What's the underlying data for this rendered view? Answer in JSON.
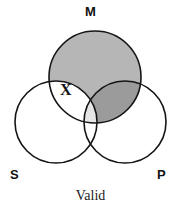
{
  "figure": {
    "caption": "Valid",
    "labels": {
      "middle": "M",
      "subject": "S",
      "predicate": "P"
    },
    "marks": {
      "existential_x": "X"
    }
  },
  "colors": {
    "background": "#ffffff",
    "outline": "#141414",
    "m_region_fill": "#b6b6b6",
    "m_p_overlap_fill": "#9b9b9b",
    "m_s_p_center_fill": "#e6e6e6",
    "unshaded_fill": "#ffffff",
    "label_color": "#111111"
  },
  "chart_data": {
    "type": "diagram",
    "diagram_kind": "venn-3-circle-syllogism",
    "title": "Valid",
    "circles": [
      {
        "id": "M",
        "label": "M",
        "cx": 95,
        "cy": 77,
        "r": 46,
        "label_position": "top"
      },
      {
        "id": "S",
        "label": "S",
        "cx": 56,
        "cy": 122,
        "r": 41,
        "label_position": "bottom-left"
      },
      {
        "id": "P",
        "label": "P",
        "cx": 125,
        "cy": 122,
        "r": 41,
        "label_position": "bottom-right"
      }
    ],
    "regions": [
      {
        "id": "M-only",
        "description": "M outside S and P",
        "shading": "medium-gray",
        "fill": "#b6b6b6"
      },
      {
        "id": "M-and-S",
        "description": "M intersect S outside P",
        "shading": "none",
        "fill": "#ffffff"
      },
      {
        "id": "M-and-P",
        "description": "M intersect P outside S",
        "shading": "dark-gray",
        "fill": "#9b9b9b"
      },
      {
        "id": "M-and-S-and-P",
        "description": "triple intersection",
        "shading": "light-gray",
        "fill": "#e6e6e6"
      },
      {
        "id": "S-only",
        "description": "S outside M and P",
        "shading": "none",
        "fill": "#ffffff"
      },
      {
        "id": "P-only",
        "description": "P outside M and S",
        "shading": "none",
        "fill": "#ffffff"
      },
      {
        "id": "S-and-P",
        "description": "S intersect P outside M",
        "shading": "none",
        "fill": "#ffffff"
      }
    ],
    "annotations": [
      {
        "text": "X",
        "region": "M-and-S",
        "x": 67,
        "y": 90,
        "meaning": "existential marker"
      }
    ]
  }
}
